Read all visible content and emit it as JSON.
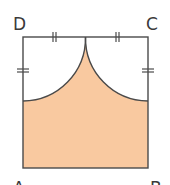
{
  "diagram": {
    "colors": {
      "fill": "#F9C9A0",
      "stroke": "#4a4a4a",
      "background": "#FFFFFF"
    },
    "vertices": [
      {
        "name": "D",
        "label": "D",
        "x": 23,
        "y": 37
      },
      {
        "name": "C",
        "label": "C",
        "x": 148,
        "y": 37
      },
      {
        "name": "B",
        "label": "B",
        "x": 148,
        "y": 168
      },
      {
        "name": "A",
        "label": "A",
        "x": 23,
        "y": 168
      }
    ],
    "labels": {
      "D": "D",
      "C": "C",
      "A": "A",
      "B": "B"
    },
    "arcs": [
      {
        "center": "D",
        "radius_ratio": 0.5
      },
      {
        "center": "C",
        "radius_ratio": 0.5
      }
    ],
    "equal_marks": {
      "type": "double-tick",
      "segments": [
        "D-M",
        "M-C",
        "D-left-arc-end",
        "C-right-arc-end"
      ]
    },
    "shaded_region": "Region of square below both quarter-circle arcs"
  }
}
